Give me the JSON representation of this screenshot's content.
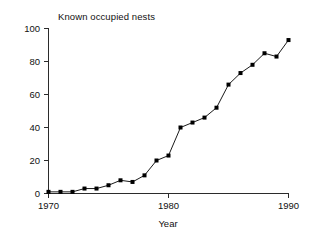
{
  "chart_data": {
    "type": "line",
    "title": "Known occupied nests",
    "xlabel": "Year",
    "ylabel": "",
    "x": [
      1970,
      1971,
      1972,
      1973,
      1974,
      1975,
      1976,
      1977,
      1978,
      1979,
      1980,
      1981,
      1982,
      1983,
      1984,
      1985,
      1986,
      1987,
      1988,
      1989,
      1990
    ],
    "values": [
      1,
      1,
      1,
      3,
      3,
      5,
      8,
      7,
      11,
      20,
      23,
      40,
      43,
      46,
      52,
      66,
      73,
      78,
      85,
      83,
      93
    ],
    "series": [
      {
        "name": "Known occupied nests",
        "values": [
          1,
          1,
          1,
          3,
          3,
          5,
          8,
          7,
          11,
          20,
          23,
          40,
          43,
          46,
          52,
          66,
          73,
          78,
          85,
          83,
          93
        ]
      }
    ],
    "xlim": [
      1970,
      1990
    ],
    "ylim": [
      0,
      100
    ],
    "xticks": [
      1970,
      1980,
      1990
    ],
    "xtick_labels": [
      "1970",
      "1980",
      "1990"
    ],
    "yticks": [
      0,
      20,
      40,
      60,
      80,
      100
    ],
    "ytick_labels": [
      "0",
      "20",
      "40",
      "60",
      "80",
      "100"
    ],
    "grid": false,
    "legend": false,
    "marker": "square",
    "line_color": "#1a1a1a",
    "marker_color": "#000000",
    "background_color": "#ffffff"
  },
  "axes": {
    "y_tick_labels": [
      "100",
      "80",
      "60",
      "40",
      "20",
      "0"
    ],
    "x_tick_labels": [
      "1970",
      "1980",
      "1990"
    ],
    "x_axis_title": "Year"
  }
}
